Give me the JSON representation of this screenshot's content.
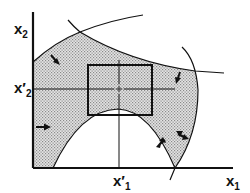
{
  "diagram": {
    "title": "",
    "axes": {
      "x_label": "x",
      "x_sub": "1",
      "y_label": "x",
      "y_sub": "2",
      "x_tick_label": "x′",
      "x_tick_sub": "1",
      "y_tick_label": "x′",
      "y_tick_sub": "2"
    },
    "elements": {
      "feasible_region": "shaded region bounded by curves",
      "box": "rectangle centered at (x1', x2')",
      "center_mark": "+",
      "arrows_count": 5
    },
    "colors": {
      "line": "#111111",
      "shade": "#b8b8b8",
      "background": "#ffffff"
    }
  }
}
